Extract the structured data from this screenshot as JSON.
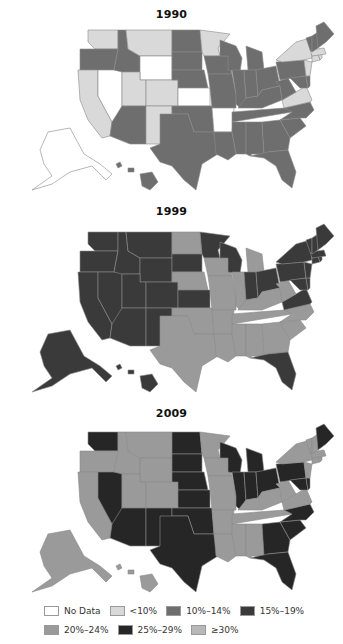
{
  "chart_data": {
    "type": "choropleth-map",
    "title": "",
    "maps": [
      {
        "title": "1990",
        "categories": {
          "no_data": [
            "WY",
            "NV",
            "KS",
            "AR",
            "AK"
          ],
          "lt10": [
            "WA",
            "MT",
            "MN",
            "CA",
            "UT",
            "CO",
            "NM",
            "NY",
            "VA",
            "NJ",
            "MA",
            "RI",
            "CT"
          ],
          "10_14": [
            "OR",
            "ID",
            "ND",
            "SD",
            "NE",
            "IA",
            "WI",
            "MI",
            "IL",
            "IN",
            "OH",
            "PA",
            "KY",
            "TN",
            "WV",
            "NC",
            "SC",
            "GA",
            "AL",
            "MS",
            "LA",
            "TX",
            "OK",
            "MO",
            "AZ",
            "FL",
            "ME",
            "NH",
            "VT",
            "MD",
            "DE",
            "HI"
          ]
        }
      },
      {
        "title": "1999",
        "categories": {
          "15_19": [
            "WA",
            "OR",
            "CA",
            "NV",
            "ID",
            "MT",
            "WY",
            "UT",
            "AZ",
            "NM",
            "SD",
            "MN",
            "WI",
            "IN",
            "OH",
            "PA",
            "NY",
            "VA",
            "MD",
            "DE",
            "NJ",
            "ME",
            "NH",
            "VT",
            "MA",
            "CT",
            "RI",
            "FL",
            "AK",
            "HI",
            "CO",
            "KS"
          ],
          "20_24": [
            "ND",
            "NE",
            "IA",
            "MI",
            "IL",
            "MO",
            "KY",
            "WV",
            "TN",
            "NC",
            "SC",
            "GA",
            "AL",
            "MS",
            "LA",
            "AR",
            "OK",
            "TX"
          ]
        }
      },
      {
        "title": "2009",
        "categories": {
          "25_29": [
            "WA",
            "NV",
            "AZ",
            "NM",
            "ND",
            "SD",
            "NE",
            "KS",
            "WI",
            "MI",
            "IL",
            "IN",
            "OH",
            "PA",
            "MD",
            "DE",
            "NC",
            "SC",
            "GA",
            "FL",
            "TX",
            "OK",
            "ME"
          ],
          "20_24": [
            "OR",
            "CA",
            "ID",
            "MT",
            "WY",
            "UT",
            "CO",
            "MN",
            "IA",
            "MO",
            "AR",
            "LA",
            "MS",
            "AL",
            "TN",
            "KY",
            "WV",
            "VA",
            "NY",
            "NJ",
            "CT",
            "MA",
            "NH",
            "VT",
            "RI",
            "AK",
            "HI"
          ]
        }
      }
    ],
    "legend": [
      {
        "key": "no_data",
        "label": "No Data",
        "color": "#ffffff"
      },
      {
        "key": "lt10",
        "label": "<10%",
        "color": "#d9d9d9"
      },
      {
        "key": "10_14",
        "label": "10%–14%",
        "color": "#6e6e6e"
      },
      {
        "key": "15_19",
        "label": "15%–19%",
        "color": "#3a3a3a"
      },
      {
        "key": "20_24",
        "label": "20%–24%",
        "color": "#9a9a9a"
      },
      {
        "key": "25_29",
        "label": "25%–29%",
        "color": "#262626"
      },
      {
        "key": "ge30",
        "label": "≥30%",
        "color": "#b8b8b8"
      }
    ]
  },
  "panels": [
    {
      "title": "1990"
    },
    {
      "title": "1999"
    },
    {
      "title": "2009"
    }
  ],
  "legend": {
    "row1": [
      {
        "label": "No Data"
      },
      {
        "label": "<10%"
      },
      {
        "label": "10%–14%"
      },
      {
        "label": "15%–19%"
      }
    ],
    "row2": [
      {
        "label": "20%–24%"
      },
      {
        "label": "25%–29%"
      },
      {
        "label": "≥30%"
      }
    ]
  }
}
